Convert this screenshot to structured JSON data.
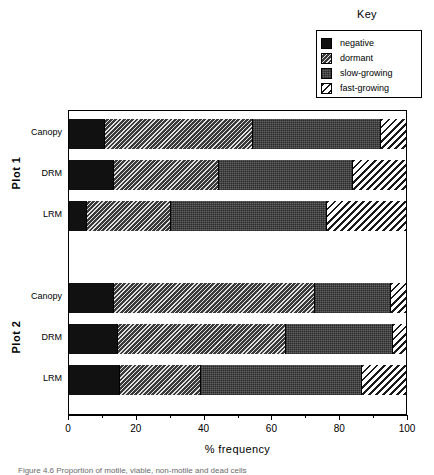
{
  "key": {
    "title": "Key",
    "entries": [
      {
        "label": "negative",
        "swatch": "solid-black-swatch"
      },
      {
        "label": "dormant",
        "swatch": "diagonal-hatch-dark-swatch"
      },
      {
        "label": "slow-growing",
        "swatch": "stipple-grey-swatch"
      },
      {
        "label": "fast-growing",
        "swatch": "diagonal-hatch-light-swatch"
      }
    ]
  },
  "axis": {
    "title": "% frequency",
    "ticks": [
      "0",
      "20",
      "40",
      "60",
      "80",
      "100"
    ]
  },
  "caption": "Figure 4.6 Proportion of motile, viable, non-motile and dead cells",
  "groups": [
    {
      "name": "Plot 1",
      "categories": [
        "Canopy",
        "DRM",
        "LRM"
      ]
    },
    {
      "name": "Plot 2",
      "categories": [
        "Canopy",
        "DRM",
        "LRM"
      ]
    }
  ],
  "chart_data": {
    "type": "bar",
    "orientation": "horizontal",
    "stacked": true,
    "title": "",
    "xlabel": "% frequency",
    "ylabel": "",
    "xlim": [
      0,
      100
    ],
    "xticks": [
      0,
      20,
      40,
      60,
      80,
      100
    ],
    "grid": false,
    "legend_position": "top-right",
    "legend_title": "Key",
    "series": [
      {
        "name": "negative",
        "values": [
          10.7,
          13.3,
          5.3,
          13.3,
          14.4,
          15.0
        ]
      },
      {
        "name": "dormant",
        "values": [
          43.8,
          31.2,
          25.1,
          59.6,
          49.9,
          24.2
        ]
      },
      {
        "name": "slow-growing",
        "values": [
          38.1,
          39.9,
          46.3,
          22.7,
          31.9,
          47.8
        ]
      },
      {
        "name": "fast-growing",
        "values": [
          7.4,
          15.6,
          23.3,
          4.4,
          3.8,
          13.0
        ]
      }
    ],
    "categories": [
      "Plot 1 Canopy",
      "Plot 1 DRM",
      "Plot 1 LRM",
      "Plot 2 Canopy",
      "Plot 2 DRM",
      "Plot 2 LRM"
    ],
    "bars": [
      {
        "group": "Plot 1",
        "category": "Canopy",
        "segments": [
          {
            "name": "negative",
            "value": 10.7,
            "start": 0,
            "end": 10.7
          },
          {
            "name": "dormant",
            "value": 43.8,
            "start": 10.7,
            "end": 54.5
          },
          {
            "name": "slow-growing",
            "value": 38.1,
            "start": 54.5,
            "end": 92.6
          },
          {
            "name": "fast-growing",
            "value": 7.4,
            "start": 92.6,
            "end": 100
          }
        ]
      },
      {
        "group": "Plot 1",
        "category": "DRM",
        "segments": [
          {
            "name": "negative",
            "value": 13.3,
            "start": 0,
            "end": 13.3
          },
          {
            "name": "dormant",
            "value": 31.2,
            "start": 13.3,
            "end": 44.5
          },
          {
            "name": "slow-growing",
            "value": 39.9,
            "start": 44.5,
            "end": 84.4
          },
          {
            "name": "fast-growing",
            "value": 15.6,
            "start": 84.4,
            "end": 100
          }
        ]
      },
      {
        "group": "Plot 1",
        "category": "LRM",
        "segments": [
          {
            "name": "negative",
            "value": 5.3,
            "start": 0,
            "end": 5.3
          },
          {
            "name": "dormant",
            "value": 25.1,
            "start": 5.3,
            "end": 30.4
          },
          {
            "name": "slow-growing",
            "value": 46.3,
            "start": 30.4,
            "end": 76.7
          },
          {
            "name": "fast-growing",
            "value": 23.3,
            "start": 76.7,
            "end": 100
          }
        ]
      },
      {
        "group": "Plot 2",
        "category": "Canopy",
        "segments": [
          {
            "name": "negative",
            "value": 13.3,
            "start": 0,
            "end": 13.3
          },
          {
            "name": "dormant",
            "value": 59.6,
            "start": 13.3,
            "end": 72.9
          },
          {
            "name": "slow-growing",
            "value": 22.7,
            "start": 72.9,
            "end": 95.6
          },
          {
            "name": "fast-growing",
            "value": 4.4,
            "start": 95.6,
            "end": 100
          }
        ]
      },
      {
        "group": "Plot 2",
        "category": "DRM",
        "segments": [
          {
            "name": "negative",
            "value": 14.4,
            "start": 0,
            "end": 14.4
          },
          {
            "name": "dormant",
            "value": 49.9,
            "start": 14.4,
            "end": 64.3
          },
          {
            "name": "slow-growing",
            "value": 31.9,
            "start": 64.3,
            "end": 96.2
          },
          {
            "name": "fast-growing",
            "value": 3.8,
            "start": 96.2,
            "end": 100
          }
        ]
      },
      {
        "group": "Plot 2",
        "category": "LRM",
        "segments": [
          {
            "name": "negative",
            "value": 15.0,
            "start": 0,
            "end": 15.0
          },
          {
            "name": "dormant",
            "value": 24.2,
            "start": 15.0,
            "end": 39.2
          },
          {
            "name": "slow-growing",
            "value": 47.8,
            "start": 39.2,
            "end": 87.0
          },
          {
            "name": "fast-growing",
            "value": 13.0,
            "start": 87.0,
            "end": 100
          }
        ]
      }
    ]
  }
}
